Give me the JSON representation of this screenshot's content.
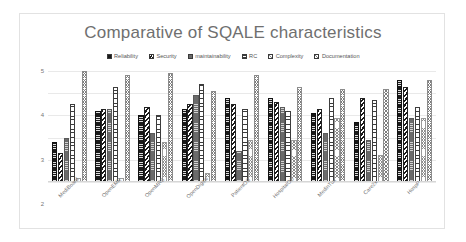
{
  "chart": {
    "title": "Comparative of SQALE characteristics",
    "legend_position": "top"
  },
  "yaxis": {
    "ticks": [
      "5",
      "4",
      "3",
      "2",
      "1",
      "0"
    ]
  },
  "chart_data": {
    "type": "bar",
    "title": "Comparative of SQALE characteristics",
    "xlabel": "",
    "ylabel": "",
    "ylim": [
      0,
      5
    ],
    "yticks": [
      0,
      1,
      2,
      3,
      4,
      5
    ],
    "grid": true,
    "legend_position": "top",
    "categories": [
      "MediBoard",
      "OpenEMR",
      "OpenMRS",
      "OpenDigital",
      "PatientOS",
      "HospitalOS",
      "MedinTux",
      "Care2x",
      "HospP"
    ],
    "series": [
      {
        "name": "Reliability",
        "pattern": "solid-black",
        "values": [
          1.8,
          3.2,
          3.0,
          3.3,
          3.8,
          3.8,
          3.1,
          2.7,
          4.6
        ]
      },
      {
        "name": "Security",
        "pattern": "diagonal-hatch",
        "values": [
          1.3,
          3.3,
          3.4,
          3.5,
          3.5,
          3.6,
          3.3,
          3.8,
          4.3
        ]
      },
      {
        "name": "maintainability",
        "pattern": "gray-horizontal",
        "values": [
          2.0,
          3.3,
          2.2,
          3.9,
          1.4,
          3.4,
          2.2,
          1.9,
          2.9
        ]
      },
      {
        "name": "RC",
        "pattern": "vertical-ladder",
        "values": [
          3.5,
          4.3,
          3.0,
          4.4,
          3.3,
          3.2,
          3.8,
          3.7,
          3.4
        ]
      },
      {
        "name": "Complexity",
        "pattern": "fine-crosshatch",
        "values": [
          0.2,
          0.2,
          1.8,
          0.4,
          1.9,
          1.9,
          2.9,
          1.2,
          2.9
        ]
      },
      {
        "name": "Documentation",
        "pattern": "crosshatch",
        "values": [
          5.0,
          4.8,
          4.9,
          4.1,
          4.8,
          4.3,
          4.2,
          4.2,
          4.6
        ]
      }
    ]
  }
}
